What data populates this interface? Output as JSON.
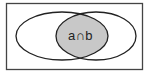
{
  "diagram": {
    "type": "venn",
    "universe": {
      "x": 6,
      "y": 3,
      "w": 137,
      "h": 67,
      "stroke": "#444444"
    },
    "sets": [
      {
        "name": "a",
        "cx": 62,
        "cy": 36,
        "rx": 46,
        "ry": 24
      },
      {
        "name": "b",
        "cx": 96,
        "cy": 36,
        "rx": 40,
        "ry": 24
      }
    ],
    "intersection": {
      "label": "a∩b",
      "fill": "#c8c8c8"
    }
  }
}
